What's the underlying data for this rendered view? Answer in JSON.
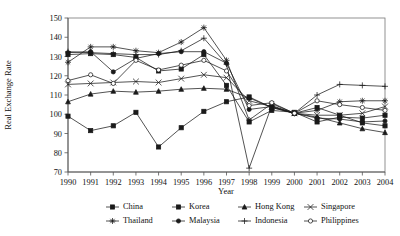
{
  "chart_data": {
    "type": "line",
    "title": "",
    "xlabel": "Year",
    "ylabel": "Real Exchange Rate",
    "x": [
      1990,
      1991,
      1992,
      1993,
      1994,
      1995,
      1996,
      1997,
      1998,
      1999,
      2000,
      2001,
      2002,
      2003,
      2004
    ],
    "xtick_labels": [
      "1990",
      "1991",
      "1992",
      "1993",
      "1994",
      "1995",
      "1996",
      "1997",
      "1998",
      "1999",
      "2000",
      "2001",
      "2002",
      "2003",
      "2004"
    ],
    "ytick_labels": [
      "70",
      "80",
      "90",
      "100",
      "110",
      "120",
      "130",
      "140",
      "150"
    ],
    "ylim": [
      70,
      150
    ],
    "ytick_step": 10,
    "grid": false,
    "legend_position": "bottom",
    "legend_columns": 4,
    "series": [
      {
        "name": "China",
        "marker": "filled-square",
        "values": [
          99.0,
          91.5,
          94.0,
          101.0,
          83.0,
          93.0,
          101.5,
          106.5,
          109.0,
          103.5,
          100.5,
          103.5,
          99.5,
          95.5,
          94.0
        ]
      },
      {
        "name": "Korea",
        "marker": "filled-square",
        "values": [
          131.0,
          131.5,
          131.0,
          129.5,
          122.5,
          123.5,
          131.0,
          115.0,
          96.0,
          102.0,
          101.0,
          96.0,
          98.5,
          98.0,
          99.5
        ]
      },
      {
        "name": "Hong Kong",
        "marker": "filled-triangle",
        "values": [
          106.5,
          110.5,
          112.0,
          111.5,
          112.0,
          113.0,
          113.5,
          113.0,
          108.5,
          103.5,
          100.5,
          98.5,
          95.5,
          92.5,
          90.5
        ]
      },
      {
        "name": "Singapore",
        "marker": "cross-x",
        "values": [
          115.5,
          116.0,
          116.5,
          117.0,
          116.5,
          118.5,
          120.5,
          119.0,
          107.0,
          104.0,
          100.5,
          99.5,
          99.5,
          100.5,
          104.0
        ]
      },
      {
        "name": "Thailand",
        "marker": "star",
        "values": [
          127.0,
          135.0,
          135.0,
          133.0,
          132.0,
          137.5,
          145.0,
          128.0,
          97.0,
          105.5,
          100.5,
          102.0,
          106.5,
          107.0,
          107.0
        ]
      },
      {
        "name": "Malaysia",
        "marker": "filled-circle",
        "values": [
          132.0,
          132.5,
          122.0,
          129.0,
          131.5,
          132.5,
          132.5,
          126.5,
          102.5,
          104.0,
          100.5,
          98.0,
          97.5,
          96.0,
          96.5
        ]
      },
      {
        "name": "Indonesia",
        "marker": "plus",
        "values": [
          132.5,
          132.0,
          131.5,
          131.0,
          131.0,
          133.0,
          139.5,
          126.0,
          72.0,
          104.5,
          100.5,
          110.0,
          115.5,
          115.0,
          114.5
        ]
      },
      {
        "name": "Philippines",
        "marker": "open-circle",
        "values": [
          117.5,
          120.5,
          116.0,
          128.0,
          123.0,
          125.5,
          128.0,
          122.5,
          104.5,
          106.0,
          100.5,
          107.0,
          105.0,
          103.5,
          102.0
        ]
      }
    ]
  },
  "legend": {
    "items": [
      {
        "label": "China"
      },
      {
        "label": "Korea"
      },
      {
        "label": "Hong Kong"
      },
      {
        "label": "Singapore"
      },
      {
        "label": "Thailand"
      },
      {
        "label": "Malaysia"
      },
      {
        "label": "Indonesia"
      },
      {
        "label": "Philippines"
      }
    ]
  },
  "colors": {
    "line": "#1a1a1a",
    "axis": "#555555",
    "frame": "#777777",
    "text": "#111111",
    "background": "#ffffff"
  }
}
